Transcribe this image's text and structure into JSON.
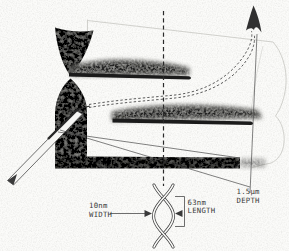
{
  "annotations": {
    "width": {
      "value": "10nm",
      "label": "WIDTH"
    },
    "length": {
      "value": "63nm",
      "label": "LENGTH"
    },
    "depth": {
      "value": "1.5μm",
      "label": "DEPTH"
    }
  },
  "icons": {
    "trajectory_arrowhead": "arrow-up-icon",
    "width_arrow_left": "arrow-right-icon",
    "width_arrow_right": "arrow-left-icon"
  },
  "colors": {
    "paper": "#fbfbf9",
    "ink": "#3a3a3a",
    "groove_bar": "#1b1b1b",
    "stipple_gray": "#969693",
    "band_gray": "#6f6f6c",
    "faint_outline": "#c6c6c2"
  }
}
